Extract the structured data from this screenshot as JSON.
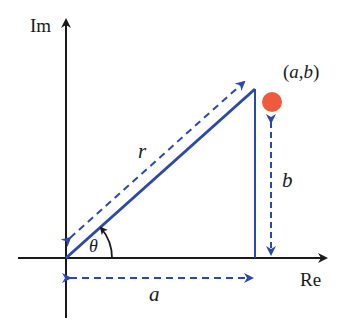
{
  "diagram": {
    "axes": {
      "y_label": "Im",
      "x_label": "Re"
    },
    "point": {
      "label": "(a,b)",
      "color": "#ef5a3c"
    },
    "labels": {
      "r": "r",
      "theta": "θ",
      "a": "a",
      "b": "b"
    },
    "colors": {
      "axis": "#1a1a1a",
      "vector": "#2b4aa8",
      "dashed": "#2b4aa8"
    }
  }
}
